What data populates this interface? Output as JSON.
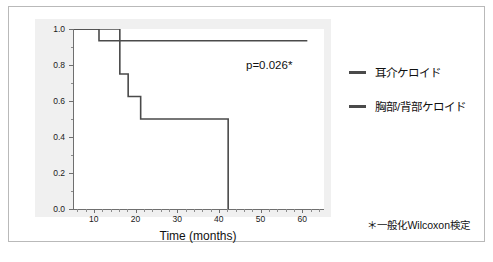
{
  "chart_data": {
    "type": "line",
    "title": "",
    "xlabel": "Time (months)",
    "ylabel": "Keloid recurrence-free interval",
    "xlim": [
      5,
      65
    ],
    "ylim": [
      0.0,
      1.0
    ],
    "grid": false,
    "legend_position": "right",
    "xticks": [
      10,
      20,
      30,
      40,
      50,
      60
    ],
    "xtick_labels": [
      "10",
      "20",
      "30",
      "40",
      "50",
      "60"
    ],
    "yticks": [
      0.0,
      0.2,
      0.4,
      0.6,
      0.8,
      1.0
    ],
    "ytick_labels": [
      "0.0",
      "0.2",
      "0.4",
      "0.6",
      "0.8",
      "1.0"
    ],
    "annotations": [
      {
        "name": "p-value",
        "text": "p=0.026*"
      }
    ],
    "footnote": "＊一般化Wilcoxon検定",
    "series": [
      {
        "name": "耳介ケロイド",
        "step": "post",
        "color": "#4a4a4a",
        "x": [
          5,
          11,
          61
        ],
        "y": [
          1.0,
          0.935,
          0.935
        ]
      },
      {
        "name": "胸部/背部ケロイド",
        "step": "post",
        "color": "#4a4a4a",
        "x": [
          5,
          16,
          18,
          21,
          42,
          42
        ],
        "y": [
          1.0,
          0.75,
          0.625,
          0.5,
          0.5,
          0.0
        ]
      }
    ]
  },
  "legend": {
    "items": [
      {
        "label": "耳介ケロイド"
      },
      {
        "label": "胸部/背部ケロイド"
      }
    ]
  }
}
